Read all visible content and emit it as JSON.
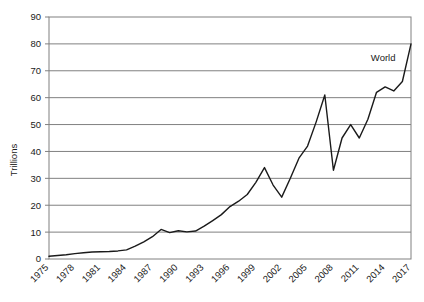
{
  "chart_data": {
    "type": "line",
    "title": "",
    "xlabel": "",
    "ylabel": "Trillions",
    "ylim": [
      0,
      90
    ],
    "ytick_step": 10,
    "yticks": [
      0,
      10,
      20,
      30,
      40,
      50,
      60,
      70,
      80,
      90
    ],
    "xlim": [
      1975,
      2017
    ],
    "xtick_step": 3,
    "xticks": [
      1975,
      1978,
      1981,
      1984,
      1987,
      1990,
      1993,
      1996,
      1999,
      2002,
      2005,
      2008,
      2011,
      2014,
      2017
    ],
    "grid": "horizontal",
    "legend_position": "inline-annotation",
    "line_color": "#1a1a1a",
    "gridline_color": "#808080",
    "border_color": "#808080",
    "background_color": "#ffffff",
    "annotations": [
      {
        "text": "World",
        "x": 2015.2,
        "y": 73.5
      }
    ],
    "series": [
      {
        "name": "World",
        "x": [
          1975,
          1976,
          1977,
          1978,
          1979,
          1980,
          1981,
          1982,
          1983,
          1984,
          1985,
          1986,
          1987,
          1988,
          1989,
          1990,
          1991,
          1992,
          1993,
          1994,
          1995,
          1996,
          1997,
          1998,
          1999,
          2000,
          2001,
          2002,
          2003,
          2004,
          2005,
          2006,
          2007,
          2008,
          2009,
          2010,
          2011,
          2012,
          2013,
          2014,
          2015,
          2016,
          2017
        ],
        "values": [
          1.0,
          1.3,
          1.6,
          2.0,
          2.3,
          2.6,
          2.7,
          2.8,
          3.0,
          3.4,
          4.8,
          6.4,
          8.3,
          11.0,
          9.8,
          10.5,
          10.1,
          10.4,
          12.2,
          14.3,
          16.5,
          19.5,
          21.5,
          24.0,
          28.5,
          34.0,
          27.5,
          23.0,
          30.0,
          37.5,
          42.0,
          51.0,
          61.0,
          33.0,
          45.0,
          50.0,
          45.0,
          52.0,
          62.0,
          64.0,
          62.5,
          66.0,
          80.0
        ]
      }
    ]
  }
}
